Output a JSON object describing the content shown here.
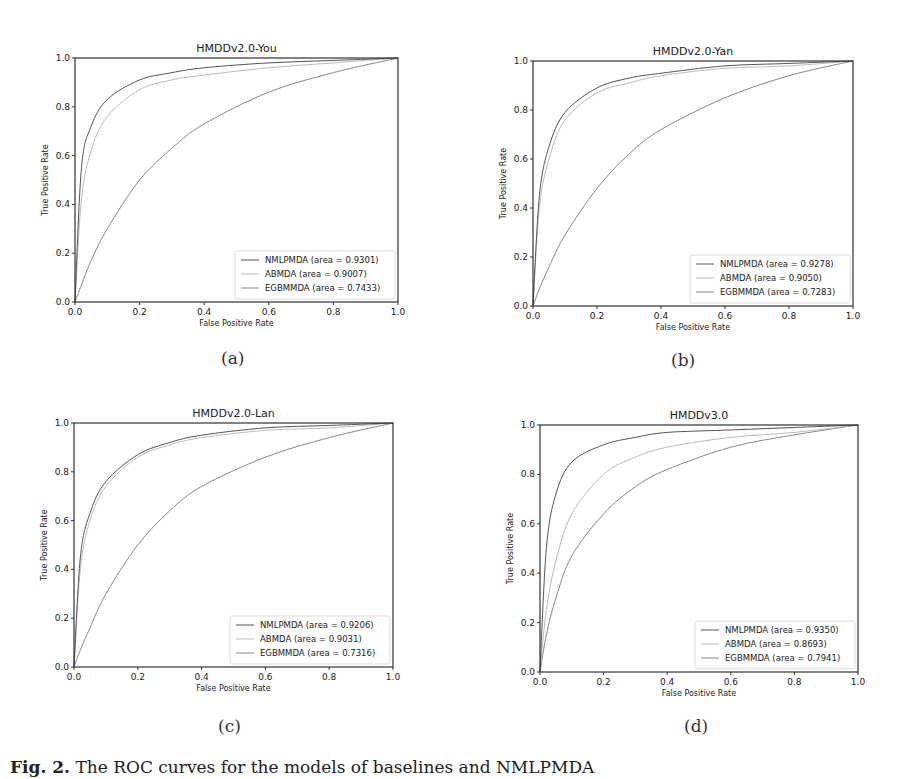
{
  "figure": {
    "caption_label": "Fig. 2.",
    "caption_text": "The ROC curves for the models of baselines and NMLPMDA",
    "colors": {
      "NMLPMDA": "#555555",
      "ABMDA": "#bbbbbb",
      "EGBMMDA": "#888888",
      "frame": "#333333"
    }
  },
  "panels": [
    {
      "label": "(a)",
      "title": "HMDDv2.0-You",
      "xlabel": "False Positive Rate",
      "ylabel": "True Positive Rate",
      "legend": [
        "NMLPMDA (area = 0.9301)",
        "ABMDA (area = 0.9007)",
        "EGBMMDA (area = 0.7433)"
      ]
    },
    {
      "label": "(b)",
      "title": "HMDDv2.0-Yan",
      "xlabel": "False Positive Rate",
      "ylabel": "True Positive Rate",
      "legend": [
        "NMLPMDA (area = 0.9278)",
        "ABMDA (area = 0.9050)",
        "EGBMMDA (area = 0.7283)"
      ]
    },
    {
      "label": "(c)",
      "title": "HMDDv2.0-Lan",
      "xlabel": "False Positive Rate",
      "ylabel": "True Positive Rate",
      "legend": [
        "NMLPMDA (area = 0.9206)",
        "ABMDA (area = 0.9031)",
        "EGBMMDA (area = 0.7316)"
      ]
    },
    {
      "label": "(d)",
      "title": "HMDDv3.0",
      "xlabel": "False Positive Rate",
      "ylabel": "True Positive Rate",
      "legend": [
        "NMLPMDA (area = 0.9350)",
        "ABMDA (area = 0.8693)",
        "EGBMMDA (area = 0.7941)"
      ]
    }
  ],
  "chart_data": [
    {
      "type": "line",
      "title": "HMDDv2.0-You",
      "xlabel": "False Positive Rate",
      "ylabel": "True Positive Rate",
      "xlim": [
        0,
        1
      ],
      "ylim": [
        0,
        1
      ],
      "xticks": [
        "0.0",
        "0.2",
        "0.4",
        "0.6",
        "0.8",
        "1.0"
      ],
      "yticks": [
        "0.0",
        "0.2",
        "0.4",
        "0.6",
        "0.8",
        "1.0"
      ],
      "legend_position": "lower right",
      "grid": false,
      "x": [
        0,
        0.02,
        0.05,
        0.1,
        0.2,
        0.3,
        0.4,
        0.6,
        0.8,
        1.0
      ],
      "series": [
        {
          "name": "NMLPMDA",
          "auc": 0.9301,
          "values": [
            0,
            0.55,
            0.72,
            0.83,
            0.91,
            0.94,
            0.96,
            0.98,
            0.99,
            1.0
          ]
        },
        {
          "name": "ABMDA",
          "auc": 0.9007,
          "values": [
            0,
            0.42,
            0.62,
            0.76,
            0.87,
            0.91,
            0.93,
            0.96,
            0.98,
            1.0
          ]
        },
        {
          "name": "EGBMMDA",
          "auc": 0.7433,
          "values": [
            0,
            0.07,
            0.17,
            0.3,
            0.5,
            0.63,
            0.73,
            0.86,
            0.94,
            1.0
          ]
        }
      ]
    },
    {
      "type": "line",
      "title": "HMDDv2.0-Yan",
      "xlabel": "False Positive Rate",
      "ylabel": "True Positive Rate",
      "xlim": [
        0,
        1
      ],
      "ylim": [
        0,
        1
      ],
      "xticks": [
        "0.0",
        "0.2",
        "0.4",
        "0.6",
        "0.8",
        "1.0"
      ],
      "yticks": [
        "0.0",
        "0.2",
        "0.4",
        "0.6",
        "0.8",
        "1.0"
      ],
      "legend_position": "lower right",
      "grid": false,
      "x": [
        0,
        0.02,
        0.05,
        0.1,
        0.2,
        0.3,
        0.4,
        0.6,
        0.8,
        1.0
      ],
      "series": [
        {
          "name": "NMLPMDA",
          "auc": 0.9278,
          "values": [
            0,
            0.45,
            0.65,
            0.79,
            0.89,
            0.93,
            0.95,
            0.98,
            0.99,
            1.0
          ]
        },
        {
          "name": "ABMDA",
          "auc": 0.905,
          "values": [
            0,
            0.4,
            0.6,
            0.76,
            0.87,
            0.91,
            0.94,
            0.97,
            0.98,
            1.0
          ]
        },
        {
          "name": "EGBMMDA",
          "auc": 0.7283,
          "values": [
            0,
            0.07,
            0.16,
            0.29,
            0.48,
            0.62,
            0.72,
            0.85,
            0.94,
            1.0
          ]
        }
      ]
    },
    {
      "type": "line",
      "title": "HMDDv2.0-Lan",
      "xlabel": "False Positive Rate",
      "ylabel": "True Positive Rate",
      "xlim": [
        0,
        1
      ],
      "ylim": [
        0,
        1
      ],
      "xticks": [
        "0.0",
        "0.2",
        "0.4",
        "0.6",
        "0.8",
        "1.0"
      ],
      "yticks": [
        "0.0",
        "0.2",
        "0.4",
        "0.6",
        "0.8",
        "1.0"
      ],
      "legend_position": "lower right",
      "grid": false,
      "x": [
        0,
        0.02,
        0.05,
        0.1,
        0.2,
        0.3,
        0.4,
        0.6,
        0.8,
        1.0
      ],
      "series": [
        {
          "name": "NMLPMDA",
          "auc": 0.9206,
          "values": [
            0,
            0.45,
            0.63,
            0.76,
            0.87,
            0.92,
            0.95,
            0.98,
            0.99,
            1.0
          ]
        },
        {
          "name": "ABMDA",
          "auc": 0.9031,
          "values": [
            0,
            0.4,
            0.6,
            0.74,
            0.86,
            0.91,
            0.94,
            0.97,
            0.98,
            1.0
          ]
        },
        {
          "name": "EGBMMDA",
          "auc": 0.7316,
          "values": [
            0,
            0.07,
            0.16,
            0.3,
            0.5,
            0.64,
            0.74,
            0.86,
            0.94,
            1.0
          ]
        }
      ]
    },
    {
      "type": "line",
      "title": "HMDDv3.0",
      "xlabel": "False Positive Rate",
      "ylabel": "True Positive Rate",
      "xlim": [
        0,
        1
      ],
      "ylim": [
        0,
        1
      ],
      "xticks": [
        "0.0",
        "0.2",
        "0.4",
        "0.6",
        "0.8",
        "1.0"
      ],
      "yticks": [
        "0.0",
        "0.2",
        "0.4",
        "0.6",
        "0.8",
        "1.0"
      ],
      "legend_position": "lower right",
      "grid": false,
      "x": [
        0,
        0.02,
        0.05,
        0.1,
        0.2,
        0.3,
        0.4,
        0.6,
        0.8,
        1.0
      ],
      "series": [
        {
          "name": "NMLPMDA",
          "auc": 0.935,
          "values": [
            0,
            0.5,
            0.72,
            0.85,
            0.92,
            0.95,
            0.97,
            0.98,
            0.99,
            1.0
          ]
        },
        {
          "name": "ABMDA",
          "auc": 0.8693,
          "values": [
            0,
            0.25,
            0.45,
            0.64,
            0.8,
            0.87,
            0.91,
            0.95,
            0.97,
            1.0
          ]
        },
        {
          "name": "EGBMMDA",
          "auc": 0.7941,
          "values": [
            0,
            0.15,
            0.3,
            0.47,
            0.64,
            0.75,
            0.82,
            0.91,
            0.96,
            1.0
          ]
        }
      ]
    }
  ]
}
